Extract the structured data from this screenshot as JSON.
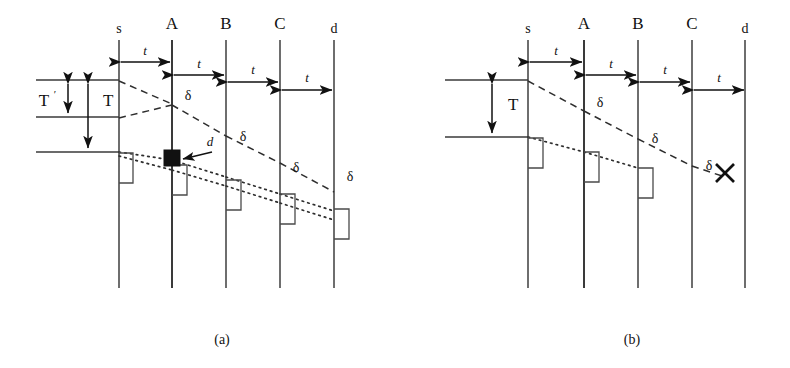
{
  "figure": {
    "subfigures": [
      {
        "id": "a",
        "caption": "(a)",
        "nodes": [
          {
            "label": "s",
            "case": "lower"
          },
          {
            "label": "A",
            "case": "upper"
          },
          {
            "label": "B",
            "case": "upper"
          },
          {
            "label": "C",
            "case": "upper"
          },
          {
            "label": "d",
            "case": "lower"
          }
        ],
        "hop_labels": [
          "t",
          "t",
          "t",
          "t"
        ],
        "delay_labels": [
          "δ",
          "δ",
          "δ",
          "δ"
        ],
        "interval_labels": [
          {
            "text": "T",
            "prime": "′"
          },
          {
            "text": "T",
            "prime": ""
          }
        ],
        "marker_labels": [
          "d"
        ],
        "failure_marker": ""
      },
      {
        "id": "b",
        "caption": "(b)",
        "nodes": [
          {
            "label": "s",
            "case": "lower"
          },
          {
            "label": "A",
            "case": "upper"
          },
          {
            "label": "B",
            "case": "upper"
          },
          {
            "label": "C",
            "case": "upper"
          },
          {
            "label": "d",
            "case": "lower"
          }
        ],
        "hop_labels": [
          "t",
          "t",
          "t",
          "t"
        ],
        "delay_labels": [
          "δ",
          "δ",
          "δ"
        ],
        "interval_labels": [
          {
            "text": "T",
            "prime": ""
          }
        ],
        "marker_labels": [],
        "failure_marker": "✕"
      }
    ],
    "colors": {
      "background": "#ffffff",
      "ink": "#111111",
      "timeline": "#4a4a4a"
    }
  }
}
